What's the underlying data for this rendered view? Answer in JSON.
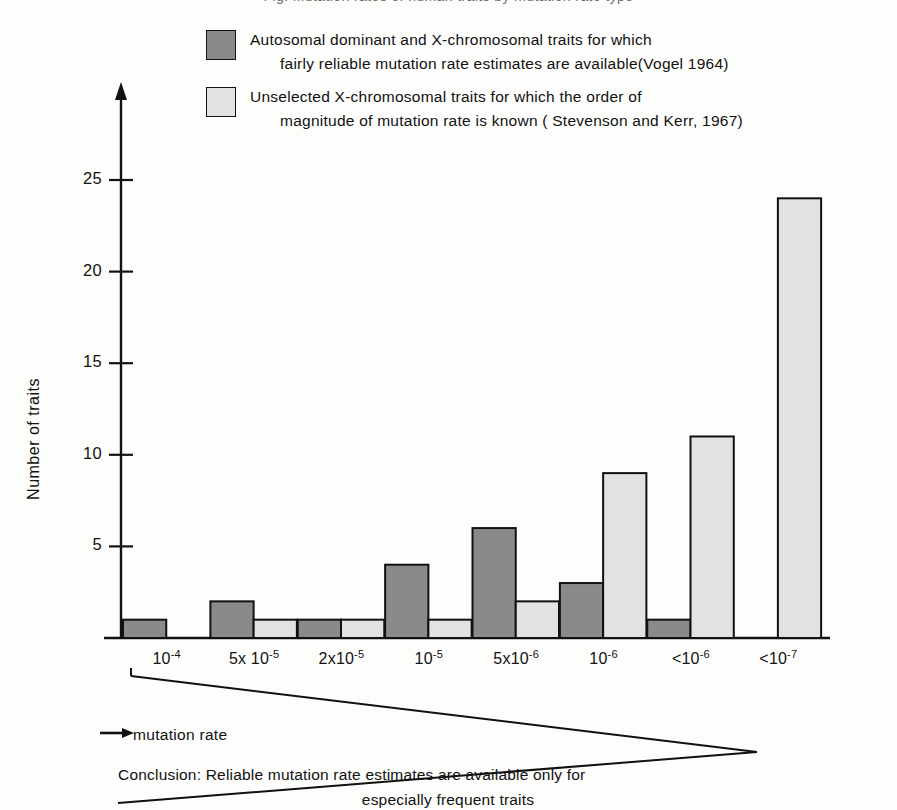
{
  "top_cut_line": "Fig. Mutation rates of human traits by mutation rate type",
  "legend": {
    "items": [
      {
        "swatch": "dark-grey",
        "color": "#8a8a8a",
        "line1": "Autosomal dominant and X-chromosomal traits for which",
        "line2": "fairly reliable mutation rate estimates are available(Vogel 1964)"
      },
      {
        "swatch": "light-grey",
        "color": "#e2e2e2",
        "line1": "Unselected X-chromosomal traits for which the order of",
        "line2": "magnitude of mutation rate is known ( Stevenson and Kerr, 1967)"
      }
    ]
  },
  "annotations": {
    "x_arrow_label": "mutation rate",
    "conclusion_line1": "Conclusion: Reliable mutation rate estimates are available only for",
    "conclusion_line2": "especially frequent traits"
  },
  "chart_data": {
    "type": "bar",
    "title": "",
    "xlabel": "mutation rate",
    "ylabel": "Number of traits",
    "categories": [
      "10⁻⁴",
      "5x10⁻⁵",
      "2x10⁻⁵",
      "10⁻⁵",
      "5x10⁻⁶",
      "10⁻⁶",
      "<10⁻⁶",
      "<10⁻⁷"
    ],
    "category_labels": [
      {
        "prefix": "10",
        "exp": "-4"
      },
      {
        "prefix": "5x 10",
        "exp": "-5"
      },
      {
        "prefix": "2x10",
        "exp": "-5"
      },
      {
        "prefix": "10",
        "exp": "-5"
      },
      {
        "prefix": "5x10",
        "exp": "-6"
      },
      {
        "prefix": "10",
        "exp": "-6"
      },
      {
        "prefix": "<10",
        "exp": "-6"
      },
      {
        "prefix": "<10",
        "exp": "-7"
      }
    ],
    "series": [
      {
        "name": "Autosomal dominant and X-chromosomal traits for which fairly reliable mutation rate estimates are available(Vogel 1964)",
        "color": "#8a8a8a",
        "values": [
          1,
          2,
          1,
          4,
          6,
          3,
          1,
          0
        ]
      },
      {
        "name": "Unselected X-chromosomal traits for which the order of magnitude of mutation rate is known ( Stevenson and Kerr, 1967)",
        "color": "#e2e2e2",
        "values": [
          0,
          1,
          1,
          1,
          2,
          9,
          11,
          24
        ]
      }
    ],
    "ylim": [
      0,
      26
    ],
    "yticks": [
      5,
      10,
      15,
      20,
      25
    ],
    "grid": false,
    "legend_position": "top"
  }
}
